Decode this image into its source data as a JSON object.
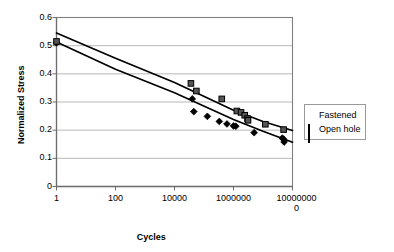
{
  "chart_data": {
    "type": "scatter",
    "title": "",
    "xlabel": "Cycles",
    "ylabel": "Normalized Stress",
    "xscale": "log",
    "xlim": [
      1,
      100000000
    ],
    "ylim": [
      0,
      0.6
    ],
    "grid": "horizontal",
    "legend_position": "right",
    "xticks": [
      "1",
      "100",
      "10000",
      "1000000",
      "100000000"
    ],
    "xtick_values": [
      1,
      100,
      10000,
      1000000,
      100000000
    ],
    "yticks": [
      "0",
      "0.1",
      "0.2",
      "0.3",
      "0.4",
      "0.5",
      "0.6"
    ],
    "ytick_values": [
      0,
      0.1,
      0.2,
      0.3,
      0.4,
      0.5,
      0.6
    ],
    "series": [
      {
        "name": "Fastened",
        "marker": "diamond",
        "color": "#000000",
        "points": [
          [
            1,
            0.51
          ],
          [
            40000,
            0.311
          ],
          [
            45000,
            0.266
          ],
          [
            130000,
            0.249
          ],
          [
            330000,
            0.231
          ],
          [
            600000,
            0.222
          ],
          [
            1000000,
            0.215
          ],
          [
            1200000,
            0.214
          ],
          [
            5000000,
            0.191
          ],
          [
            45000000,
            0.172
          ],
          [
            50000000,
            0.168
          ],
          [
            52000000,
            0.158
          ]
        ],
        "trend": [
          [
            1,
            0.513
          ],
          [
            100,
            0.416
          ],
          [
            10000,
            0.333
          ],
          [
            1000000,
            0.238
          ],
          [
            10000000,
            0.196
          ],
          [
            100000000,
            0.157
          ]
        ]
      },
      {
        "name": "Open hole",
        "marker": "square",
        "color": "#555555",
        "points": [
          [
            1,
            0.515
          ],
          [
            36000,
            0.366
          ],
          [
            55000,
            0.339
          ],
          [
            400000,
            0.311
          ],
          [
            1300000,
            0.268
          ],
          [
            1800000,
            0.263
          ],
          [
            2400000,
            0.253
          ],
          [
            3000000,
            0.241
          ],
          [
            3100000,
            0.235
          ],
          [
            12000000,
            0.221
          ],
          [
            50000000,
            0.202
          ]
        ],
        "trend": [
          [
            1,
            0.545
          ],
          [
            100,
            0.455
          ],
          [
            10000,
            0.369
          ],
          [
            1000000,
            0.271
          ],
          [
            10000000,
            0.231
          ],
          [
            100000000,
            0.199
          ]
        ]
      }
    ]
  },
  "axes": {
    "y_title": "Normalized Stress",
    "x_title": "Cycles"
  },
  "legend": {
    "items": [
      {
        "label": "Fastened",
        "marker": "diamond-marker-icon"
      },
      {
        "label": "Open hole",
        "marker": "square-marker-icon"
      }
    ]
  },
  "colors": {
    "plot_border": "#808080",
    "gridline": "#a6a6a6",
    "axis_line": "#808080",
    "series_fastened": "#000000",
    "series_open_hole": "#555555",
    "legend_border": "#9a9a9a"
  }
}
